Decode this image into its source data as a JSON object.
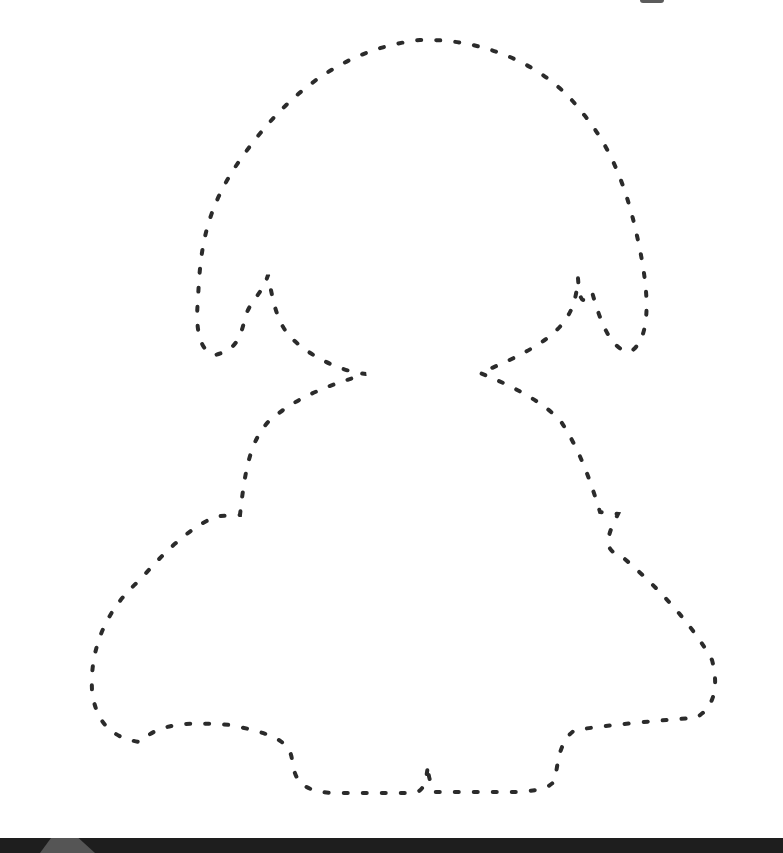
{
  "worksheet": {
    "subject": "girl-silhouette",
    "style": "dotted-tracing-outline",
    "stroke_color": "#2b2b2b",
    "background_color": "#ffffff",
    "band_color": "#1e1e1e"
  }
}
